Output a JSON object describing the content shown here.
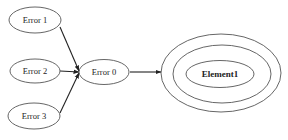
{
  "diagram": {
    "type": "directed-graph",
    "nodes": [
      {
        "id": "error1",
        "label": "Error 1",
        "shape": "ellipse",
        "style": "single"
      },
      {
        "id": "error2",
        "label": "Error 2",
        "shape": "ellipse",
        "style": "single"
      },
      {
        "id": "error3",
        "label": "Error 3",
        "shape": "ellipse",
        "style": "single"
      },
      {
        "id": "error0",
        "label": "Error 0",
        "shape": "ellipse",
        "style": "single"
      },
      {
        "id": "element1",
        "label": "Element1",
        "shape": "ellipse",
        "style": "triple-concentric",
        "bold": true
      }
    ],
    "edges": [
      {
        "from": "error1",
        "to": "error0",
        "arrow": true
      },
      {
        "from": "error2",
        "to": "error0",
        "arrow": true
      },
      {
        "from": "error3",
        "to": "error0",
        "arrow": true
      },
      {
        "from": "error0",
        "to": "element1",
        "arrow": true
      }
    ],
    "colors": {
      "background": "#ffffff",
      "stroke": "#555555",
      "edge": "#222222",
      "text": "#222222"
    }
  }
}
